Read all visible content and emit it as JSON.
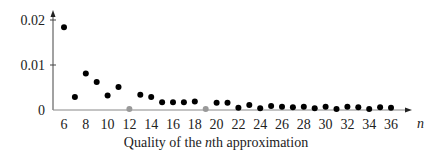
{
  "chart_data": {
    "type": "scatter",
    "title": "",
    "caption": {
      "prefix": "Quality of the ",
      "italic": "n",
      "suffix": "th approximation"
    },
    "xlabel": "n",
    "ylabel": "",
    "xlim": [
      5,
      39
    ],
    "ylim": [
      0,
      0.022
    ],
    "grid": false,
    "legend": null,
    "x_ticks": [
      6,
      8,
      10,
      12,
      14,
      16,
      18,
      20,
      22,
      24,
      26,
      28,
      30,
      32,
      34,
      36
    ],
    "y_ticks": [
      {
        "value": 0,
        "label": "0"
      },
      {
        "value": 0.01,
        "label": "0.01"
      },
      {
        "value": 0.02,
        "label": "0.02"
      }
    ],
    "series": [
      {
        "name": "approximation quality",
        "color": "#000000",
        "points": [
          {
            "x": 6,
            "y": 0.0184
          },
          {
            "x": 7,
            "y": 0.0029
          },
          {
            "x": 8,
            "y": 0.0081
          },
          {
            "x": 9,
            "y": 0.0062
          },
          {
            "x": 10,
            "y": 0.0032
          },
          {
            "x": 11,
            "y": 0.0051
          },
          {
            "x": 13,
            "y": 0.0034
          },
          {
            "x": 14,
            "y": 0.0029
          },
          {
            "x": 15,
            "y": 0.0017
          },
          {
            "x": 16,
            "y": 0.0017
          },
          {
            "x": 17,
            "y": 0.0017
          },
          {
            "x": 18,
            "y": 0.0019
          },
          {
            "x": 20,
            "y": 0.0016
          },
          {
            "x": 21,
            "y": 0.0016
          },
          {
            "x": 22,
            "y": 0.0005
          },
          {
            "x": 23,
            "y": 0.0011
          },
          {
            "x": 24,
            "y": 0.0004
          },
          {
            "x": 25,
            "y": 0.0009
          },
          {
            "x": 26,
            "y": 0.0007
          },
          {
            "x": 27,
            "y": 0.0006
          },
          {
            "x": 28,
            "y": 0.0007
          },
          {
            "x": 29,
            "y": 0.0004
          },
          {
            "x": 30,
            "y": 0.0007
          },
          {
            "x": 31,
            "y": 0.0002
          },
          {
            "x": 32,
            "y": 0.0007
          },
          {
            "x": 33,
            "y": 0.0006
          },
          {
            "x": 34,
            "y": 0.0002
          },
          {
            "x": 35,
            "y": 0.0006
          },
          {
            "x": 36,
            "y": 0.0005
          }
        ]
      },
      {
        "name": "zero-quality points",
        "color": "#999999",
        "points": [
          {
            "x": 12,
            "y": 0.0002
          },
          {
            "x": 19,
            "y": 0.0002
          }
        ]
      }
    ]
  },
  "layout": {
    "origin_px": [
      53,
      110
    ],
    "x0_value": 6,
    "x0_px": 64,
    "px_per_x": 10.9,
    "px_per_y": 4500,
    "axis_top_px": 10,
    "axis_right_px": 412
  }
}
